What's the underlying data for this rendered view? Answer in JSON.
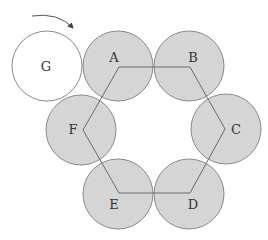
{
  "diagram": {
    "colors": {
      "fixed_coin_fill": "#d5d5d5",
      "rolling_coin_fill": "#ffffff",
      "outline": "#8a8a8a",
      "hexagon_line": "#6a6a6a"
    },
    "rolling_coin": {
      "label": "G",
      "cx": 47,
      "cy": 66,
      "r": 35
    },
    "fixed_coins": [
      {
        "label": "A",
        "cx": 118,
        "cy": 66,
        "r": 35,
        "label_x": 114,
        "label_y": 58
      },
      {
        "label": "B",
        "cx": 189,
        "cy": 66,
        "r": 35,
        "label_x": 193,
        "label_y": 58
      },
      {
        "label": "C",
        "cx": 226,
        "cy": 129,
        "r": 35,
        "label_x": 236,
        "label_y": 130
      },
      {
        "label": "D",
        "cx": 189,
        "cy": 194,
        "r": 35,
        "label_x": 193,
        "label_y": 205
      },
      {
        "label": "E",
        "cx": 118,
        "cy": 194,
        "r": 35,
        "label_x": 114,
        "label_y": 205
      },
      {
        "label": "F",
        "cx": 81,
        "cy": 130,
        "r": 35,
        "label_x": 73,
        "label_y": 130
      }
    ],
    "hexagon_vertices": [
      [
        119,
        67
      ],
      [
        190,
        67
      ],
      [
        225,
        129
      ],
      [
        190,
        193
      ],
      [
        119,
        193
      ],
      [
        83,
        130
      ]
    ],
    "arrow": {
      "direction": "clockwise",
      "icon": "curved-arrow-icon"
    }
  }
}
